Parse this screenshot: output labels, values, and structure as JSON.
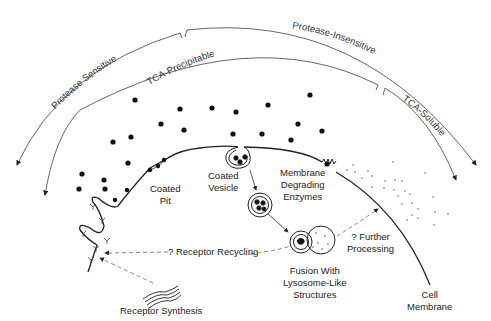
{
  "diagram": {
    "type": "receptor-mediated endocytosis schematic",
    "arc_labels": {
      "outer_left": "Protease Sensitive",
      "outer_right": "Protease-Insensitive",
      "inner_left": "TCA-Precipitable",
      "inner_right": "TCA-Soluble"
    },
    "labels": {
      "coated_pit": [
        "Coated",
        "Pit"
      ],
      "coated_vesicle": [
        "Coated",
        "Vesicle"
      ],
      "membrane_degrading": [
        "Membrane",
        "Degrading",
        "Enzymes"
      ],
      "fusion": [
        "Fusion With",
        "Lysosome-Like",
        "Structures"
      ],
      "further_processing": [
        "? Further",
        "Processing"
      ],
      "receptor_recycling": "? Receptor Recycling",
      "receptor_synthesis": "Receptor Synthesis",
      "cell_membrane": [
        "Cell",
        "Membrane"
      ]
    },
    "colors": {
      "line": "#222222",
      "arc": "#555555",
      "dashed": "#666666",
      "background": "#ffffff"
    }
  }
}
